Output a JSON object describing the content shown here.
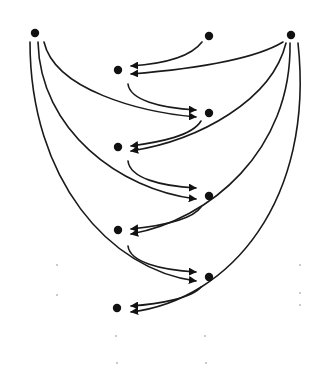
{
  "diagram": {
    "type": "directed-graph",
    "background": "#ffffff",
    "ink_color": "#111111",
    "nodes": [
      {
        "id": "A",
        "x": 35,
        "y": 33,
        "role": "top-left source"
      },
      {
        "id": "B",
        "x": 209,
        "y": 36,
        "role": "top-middle source"
      },
      {
        "id": "C",
        "x": 291,
        "y": 35,
        "role": "top-right source"
      },
      {
        "id": "L1",
        "x": 118,
        "y": 70,
        "role": "left column"
      },
      {
        "id": "R1",
        "x": 209,
        "y": 113,
        "role": "right column"
      },
      {
        "id": "L2",
        "x": 118,
        "y": 147,
        "role": "left column"
      },
      {
        "id": "R2",
        "x": 209,
        "y": 196,
        "role": "right column"
      },
      {
        "id": "L3",
        "x": 118,
        "y": 230,
        "role": "left column"
      },
      {
        "id": "R3",
        "x": 209,
        "y": 277,
        "role": "right column"
      },
      {
        "id": "L4",
        "x": 117,
        "y": 308,
        "role": "left column"
      }
    ],
    "edges": [
      {
        "from": "B",
        "to": "L1",
        "path": "M 202 42 C 190 58, 160 64, 131 66"
      },
      {
        "from": "C",
        "to": "L1",
        "path": "M 283 42 C 250 62, 180 70, 131 74"
      },
      {
        "from": "C",
        "to": "L2",
        "path": "M 286 43 C 272 100, 200 140, 131 151"
      },
      {
        "from": "C",
        "to": "L3",
        "path": "M 290 43 C 292 150, 210 220, 131 234"
      },
      {
        "from": "C",
        "to": "L4",
        "path": "M 298 43 C 315 200, 230 300, 131 312"
      },
      {
        "from": "A",
        "to": "R1",
        "path": "M 44 42 C 55 90, 140 112, 196 117"
      },
      {
        "from": "A",
        "to": "R2",
        "path": "M 38 42 C 40 130, 120 190, 196 199"
      },
      {
        "from": "A",
        "to": "R3",
        "path": "M 30 42 C 30 180, 110 270, 196 281"
      },
      {
        "from": "L1",
        "to": "R1",
        "path": "M 128 84 C 130 100, 160 108, 196 110"
      },
      {
        "from": "R1",
        "to": "L2",
        "path": "M 201 121 C 192 136, 160 142, 131 146"
      },
      {
        "from": "L2",
        "to": "R2",
        "path": "M 128 161 C 130 178, 160 186, 196 188"
      },
      {
        "from": "R2",
        "to": "L3",
        "path": "M 201 207 C 192 220, 160 226, 131 229"
      },
      {
        "from": "L3",
        "to": "R3",
        "path": "M 128 246 C 130 262, 160 270, 196 272"
      },
      {
        "from": "R3",
        "to": "L4",
        "path": "M 201 287 C 192 298, 160 304, 131 306"
      }
    ],
    "specks": [
      {
        "x": 57,
        "y": 265
      },
      {
        "x": 57,
        "y": 295
      },
      {
        "x": 116,
        "y": 336
      },
      {
        "x": 117,
        "y": 363
      },
      {
        "x": 205,
        "y": 336
      },
      {
        "x": 206,
        "y": 363
      },
      {
        "x": 300,
        "y": 265
      },
      {
        "x": 300,
        "y": 293
      },
      {
        "x": 300,
        "y": 305
      }
    ]
  }
}
